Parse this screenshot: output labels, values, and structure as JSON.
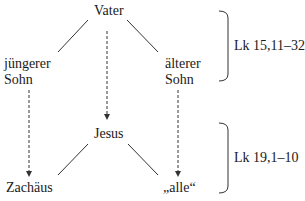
{
  "nodes": {
    "vater": "Vater",
    "juengerer_line1": "jüngerer",
    "juengerer_line2": "Sohn",
    "aelterer_line1": "älterer",
    "aelterer_line2": "Sohn",
    "jesus": "Jesus",
    "zachaeus": "Zachäus",
    "alle": "„alle“"
  },
  "brackets": {
    "top_ref": "Lk 15,11–32",
    "bottom_ref": "Lk 19,1–10"
  },
  "colors": {
    "line": "#333333",
    "text": "#1a1a1a"
  }
}
